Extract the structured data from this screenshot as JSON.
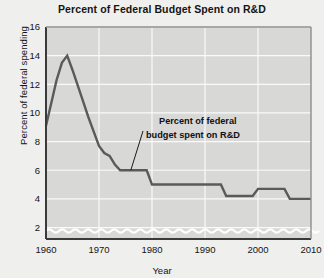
{
  "chart_data": {
    "type": "line",
    "title": "Percent of Federal Budget Spent on R&D",
    "xlabel": "Year",
    "ylabel": "Percent of federal spending",
    "xlim": [
      1960,
      2010
    ],
    "ylim": [
      1.2,
      16
    ],
    "xticks": [
      1960,
      1970,
      1980,
      1990,
      2000,
      2010
    ],
    "yticks": [
      2,
      4,
      6,
      8,
      10,
      12,
      14,
      16
    ],
    "grid": true,
    "legend": "none",
    "axis_break": "wavy band at bottom of y-axis",
    "series": [
      {
        "name": "Percent of federal budget spent on R&D",
        "color": "#5a5a5a",
        "x": [
          1960,
          1961,
          1962,
          1963,
          1964,
          1965,
          1966,
          1967,
          1968,
          1969,
          1970,
          1971,
          1972,
          1973,
          1974,
          1975,
          1976,
          1977,
          1978,
          1979,
          1980,
          1981,
          1982,
          1983,
          1984,
          1985,
          1986,
          1987,
          1988,
          1989,
          1990,
          1991,
          1992,
          1993,
          1994,
          1995,
          1996,
          1997,
          1998,
          1999,
          2000,
          2001,
          2002,
          2003,
          2004,
          2005,
          2006,
          2007,
          2008,
          2009,
          2010
        ],
        "values": [
          9.1,
          10.7,
          12.3,
          13.5,
          14.0,
          13.0,
          11.9,
          10.8,
          9.7,
          8.7,
          7.7,
          7.2,
          7.0,
          6.4,
          6.0,
          6.0,
          6.0,
          6.0,
          6.0,
          6.0,
          5.0,
          5.0,
          5.0,
          5.0,
          5.0,
          5.0,
          5.0,
          5.0,
          5.0,
          5.0,
          5.0,
          5.0,
          5.0,
          5.0,
          4.2,
          4.2,
          4.2,
          4.2,
          4.2,
          4.2,
          4.7,
          4.7,
          4.7,
          4.7,
          4.7,
          4.7,
          4.0,
          4.0,
          4.0,
          4.0,
          4.0
        ]
      }
    ],
    "annotations": [
      {
        "text_line1": "Percent of federal",
        "text_line2": "budget spent on R&D",
        "points_to_year": 1976,
        "points_to_value": 6.0
      }
    ]
  },
  "axis": {
    "ytick_labels": [
      "16",
      "14",
      "12",
      "10",
      "8",
      "6",
      "4",
      "2"
    ],
    "xtick_labels": [
      "1960",
      "1970",
      "1980",
      "1990",
      "2000",
      "2010"
    ]
  },
  "colors": {
    "plot_background": "#d8d8d7",
    "page_background": "#efefee",
    "gridline": "#fafafa",
    "line": "#5a5a5a",
    "axis": "#3a3a3a",
    "text": "#141414"
  }
}
